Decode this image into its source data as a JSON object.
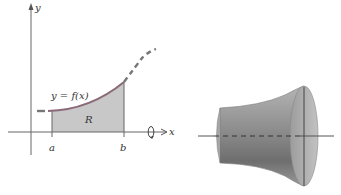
{
  "figure": {
    "left_panel": {
      "y_axis_label": "y",
      "x_axis_label": "x",
      "curve_label": "y = f(x)",
      "region_label": "R",
      "bound_a_label": "a",
      "bound_b_label": "b",
      "rotation_icon": "rotate-around-x-axis-icon"
    },
    "right_panel": {
      "description": "solid of revolution"
    },
    "colors": {
      "curve": "#8a6a78",
      "region_fill": "#c8c8c8",
      "axis": "#555555",
      "solid_fill": "#9a9a9a"
    }
  }
}
